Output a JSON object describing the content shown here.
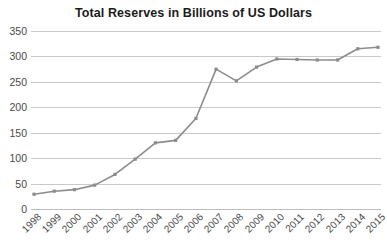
{
  "chart_data": {
    "type": "line",
    "title": "Total Reserves in Billions of US Dollars",
    "xlabel": "",
    "ylabel": "",
    "categories": [
      "1998",
      "1999",
      "2000",
      "2001",
      "2002",
      "2003",
      "2004",
      "2005",
      "2006",
      "2007",
      "2008",
      "2009",
      "2010",
      "2011",
      "2012",
      "2013",
      "2014",
      "2015"
    ],
    "values": [
      29,
      35,
      38,
      47,
      68,
      98,
      130,
      135,
      178,
      275,
      252,
      279,
      295,
      294,
      293,
      293,
      315,
      318
    ],
    "series": [
      {
        "name": "Total Reserves",
        "values": [
          29,
          35,
          38,
          47,
          68,
          98,
          130,
          135,
          178,
          275,
          252,
          279,
          295,
          294,
          293,
          293,
          315,
          318
        ]
      }
    ],
    "ylim": [
      0,
      350
    ],
    "ytick_step": 50,
    "yticks": [
      0,
      50,
      100,
      150,
      200,
      250,
      300,
      350
    ],
    "ytick_labels": [
      "0",
      "50",
      "100",
      "150",
      "200",
      "250",
      "300",
      "350"
    ],
    "grid": true,
    "legend": false,
    "legend_position": "none",
    "xtick_rotation": -45,
    "colors": {
      "line": "#8c8c8c",
      "marker": "#8c8c8c",
      "grid": "#c9c9c9",
      "axis": "#bdbdbd",
      "title": "#1b1b1b",
      "tick_label": "#4a4a4a",
      "background": "#ffffff"
    }
  }
}
